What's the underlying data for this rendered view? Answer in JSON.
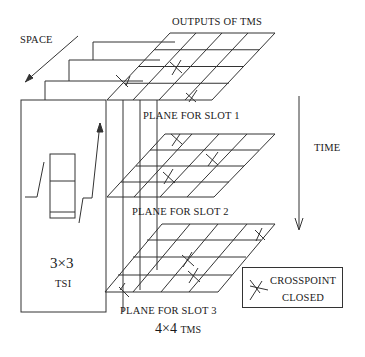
{
  "diagram": {
    "labels": {
      "space": "SPACE",
      "outputs": "OUTPUTS OF TMS",
      "plane1": "PLANE FOR SLOT 1",
      "plane2": "PLANE FOR SLOT 2",
      "plane3": "PLANE FOR SLOT 3",
      "time": "TIME",
      "tsi_size": "3×3",
      "tsi": "TSI",
      "tms_size": "4×4",
      "tms": "TMS"
    },
    "legend": {
      "symbol": "crosspoint-closed-icon",
      "line1": "CROSSPOINT",
      "line2": "CLOSED"
    },
    "planes": [
      {
        "slot": 1,
        "grid": "4x4",
        "closed_crosspoints": 3
      },
      {
        "slot": 2,
        "grid": "4x4",
        "closed_crosspoints": 3
      },
      {
        "slot": 3,
        "grid": "4x4",
        "closed_crosspoints": 4
      }
    ],
    "colors": {
      "line": "#333333",
      "background": "#ffffff"
    }
  }
}
